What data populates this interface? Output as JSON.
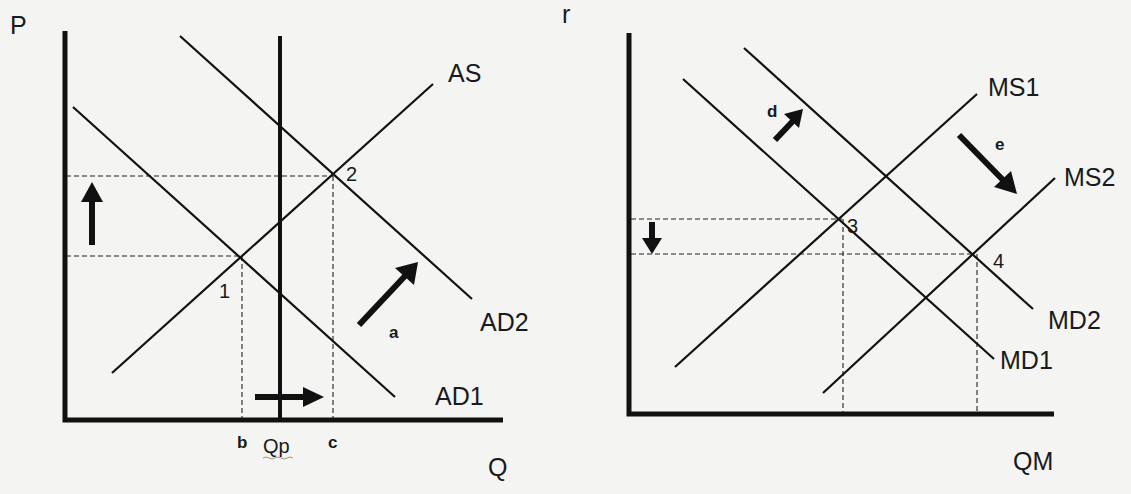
{
  "left_panel": {
    "axes": {
      "y_label": "P",
      "x_label": "Q"
    },
    "curves": [
      {
        "id": "AS",
        "label": "AS",
        "from": [
          112,
          373
        ],
        "to": [
          433,
          84
        ]
      },
      {
        "id": "AD1",
        "label": "AD1",
        "from": [
          73,
          107
        ],
        "to": [
          395,
          397
        ]
      },
      {
        "id": "AD2",
        "label": "AD2",
        "from": [
          180,
          36
        ],
        "to": [
          472,
          299
        ]
      },
      {
        "id": "Qp",
        "label": "Qp",
        "from": [
          280,
          36
        ],
        "to": [
          280,
          420
        ]
      }
    ],
    "equilibria": [
      {
        "label": "1",
        "x": 240,
        "y": 256
      },
      {
        "label": "2",
        "x": 333,
        "y": 176
      }
    ],
    "x_ticks": [
      "b",
      "Qp",
      "c"
    ],
    "arrows": [
      {
        "label": "a",
        "direction": "up-right"
      },
      {
        "label": "",
        "direction": "up"
      },
      {
        "label": "",
        "direction": "right"
      }
    ]
  },
  "right_panel": {
    "axes": {
      "y_label": "r",
      "x_label": "QM"
    },
    "curves": [
      {
        "id": "MS1",
        "label": "MS1",
        "from": [
          675,
          367
        ],
        "to": [
          977,
          94
        ]
      },
      {
        "id": "MS2",
        "label": "MS2",
        "from": [
          823,
          393
        ],
        "to": [
          1055,
          178
        ]
      },
      {
        "id": "MD1",
        "label": "MD1",
        "from": [
          683,
          79
        ],
        "to": [
          994,
          359
        ]
      },
      {
        "id": "MD2",
        "label": "MD2",
        "from": [
          744,
          48
        ],
        "to": [
          1033,
          309
        ]
      }
    ],
    "equilibria": [
      {
        "label": "3",
        "x": 842,
        "y": 219
      },
      {
        "label": "4",
        "x": 975,
        "y": 254
      }
    ],
    "arrows": [
      {
        "label": "d",
        "direction": "up-right"
      },
      {
        "label": "e",
        "direction": "down-right"
      },
      {
        "label": "",
        "direction": "down"
      }
    ]
  }
}
